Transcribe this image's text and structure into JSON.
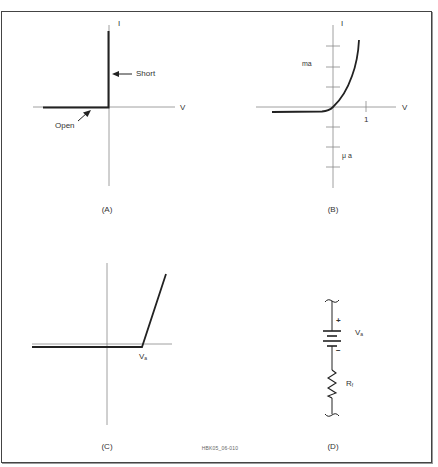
{
  "figure_id": "HBK05_06-010",
  "panels": {
    "A": {
      "caption": "(A)",
      "axis_x": "V",
      "axis_y": "I",
      "annotations": {
        "short": "Short",
        "open": "Open"
      }
    },
    "B": {
      "caption": "(B)",
      "axis_x": "V",
      "axis_y": "I",
      "tick_x_label": "1",
      "upper_unit": "ma",
      "lower_unit": "μ a"
    },
    "C": {
      "caption": "(C)",
      "knee_label": "V",
      "knee_label_sub": "a"
    },
    "D": {
      "caption": "(D)",
      "battery_label": "V",
      "battery_label_sub": "a",
      "plus": "+",
      "minus": "−",
      "resistor_label": "R",
      "resistor_label_sub": "f"
    }
  },
  "colors": {
    "line": "#222222",
    "axis": "#888888",
    "frame": "#444444",
    "text": "#333333"
  }
}
